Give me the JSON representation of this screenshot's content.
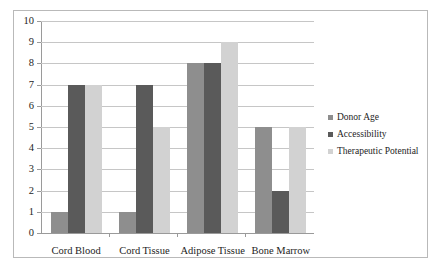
{
  "chart_data": {
    "type": "bar",
    "title": "",
    "subtitle": "",
    "xlabel": "",
    "ylabel": "",
    "categories": [
      "Cord Blood",
      "Cord Tissue",
      "Adipose Tissue",
      "Bone Marrow"
    ],
    "series": [
      {
        "name": "Donor Age",
        "values": [
          1,
          1,
          8,
          5
        ],
        "color": "#8e8e8e"
      },
      {
        "name": "Accessibility",
        "values": [
          7,
          7,
          8,
          2
        ],
        "color": "#5a5a5a"
      },
      {
        "name": "Therapeutic Potential",
        "values": [
          7,
          5,
          9,
          5
        ],
        "color": "#d2d2d2"
      }
    ],
    "ylim": [
      0,
      10
    ],
    "ytick_labels": [
      "10",
      "9",
      "8",
      "7",
      "6",
      "5",
      "4",
      "3",
      "2",
      "1",
      "0"
    ],
    "ytick_values": [
      10,
      9,
      8,
      7,
      6,
      5,
      4,
      3,
      2,
      1,
      0
    ],
    "grid": true,
    "grid_axis": "y",
    "legend_position": "right",
    "legend_entries": [
      "Donor Age",
      "Accessibility",
      "Therapeutic Potential"
    ],
    "annotations": [],
    "frame_color": "#b9b9b9",
    "gridline_color": "#c6c6c6",
    "axis_color": "#9a9a9a",
    "text_color": "#1d1d1d"
  }
}
